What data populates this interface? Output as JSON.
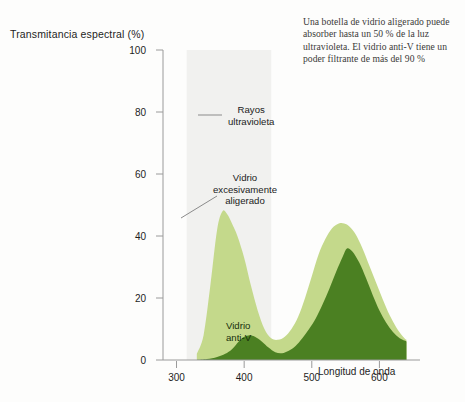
{
  "caption": "Una botella de vidrio aligerado puede absorber hasta un 50 % de la luz ultravioleta. El vidrio anti-V tiene un poder filtrante de más del 90 %",
  "colors": {
    "light_green": "#c4d98b",
    "dark_green": "#4b8022",
    "uv_band": "#f1f1ef",
    "axis": "#9a9a9a",
    "text": "#1d1d1d",
    "background": "#fdfdfc"
  },
  "annotations": {
    "uv_line1": "Rayos",
    "uv_line2": "ultravioleta",
    "overlight_line1": "Vidrio",
    "overlight_line2": "excesivamente",
    "overlight_line3": "aligerado",
    "antiv_line1": "Vidrio",
    "antiv_line2": "anti-V"
  },
  "chart_data": {
    "type": "area",
    "title": "",
    "ylabel": "Transmitancia espectral (%)",
    "xlabel": "Longitud de onda",
    "xlim": [
      280,
      660
    ],
    "ylim": [
      0,
      100
    ],
    "xticks": [
      300,
      400,
      500,
      600
    ],
    "yticks": [
      0,
      20,
      40,
      60,
      80,
      100
    ],
    "grid": false,
    "legend_position": "inline-annotations",
    "bands": [
      {
        "name": "Rayos ultravioleta",
        "x_start": 315,
        "x_end": 440,
        "y_start": 0,
        "y_end": 100,
        "color": "#f1f1ef"
      }
    ],
    "series": [
      {
        "name": "Vidrio excesivamente aligerado",
        "color": "#c4d98b",
        "x": [
          330,
          340,
          350,
          360,
          368,
          375,
          382,
          390,
          400,
          410,
          420,
          430,
          440,
          450,
          460,
          470,
          480,
          490,
          500,
          510,
          520,
          530,
          540,
          548,
          556,
          565,
          575,
          585,
          595,
          605,
          615,
          625,
          635,
          640
        ],
        "y": [
          2,
          8,
          24,
          42,
          48,
          47,
          44,
          40,
          33,
          24,
          16,
          10,
          7,
          6.5,
          7.5,
          10,
          14,
          20,
          27,
          34,
          39,
          42.5,
          44,
          44,
          43,
          40.5,
          36,
          30.5,
          25,
          19.5,
          14.5,
          10.5,
          7.5,
          6.5
        ]
      },
      {
        "name": "Vidrio anti-V",
        "color": "#4b8022",
        "x": [
          330,
          345,
          360,
          372,
          382,
          392,
          400,
          408,
          416,
          426,
          436,
          446,
          456,
          466,
          476,
          486,
          496,
          506,
          516,
          526,
          536,
          546,
          552,
          560,
          570,
          580,
          590,
          600,
          610,
          620,
          630,
          640
        ],
        "y": [
          0,
          0.3,
          1,
          2,
          3.5,
          6,
          7.5,
          8,
          7.5,
          6,
          4,
          2.5,
          2.2,
          3,
          4.5,
          7,
          10,
          13.5,
          18,
          23,
          28.5,
          33.5,
          36,
          35,
          31.5,
          26.5,
          21,
          16,
          12,
          9,
          7,
          6
        ]
      }
    ]
  },
  "axis_geometry": {
    "plot_left": 163,
    "plot_right": 420,
    "plot_top": 50,
    "plot_bottom": 360
  }
}
